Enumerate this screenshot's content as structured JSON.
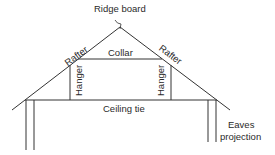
{
  "diagram": {
    "type": "roof-truss-cross-section",
    "line_color": "#333333",
    "labels": {
      "ridge": "Ridge board",
      "rafter_left": "Rafter",
      "rafter_right": "Rafter",
      "collar": "Collar",
      "hanger_left": "Hanger",
      "hanger_right": "Hanger",
      "ceiling_tie": "Ceiling tie",
      "eaves_line1": "Eaves",
      "eaves_line2": "projection"
    }
  }
}
